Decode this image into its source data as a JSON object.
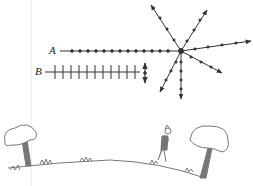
{
  "diagram": {
    "labels": {
      "ray_a": "A",
      "ray_b": "B"
    },
    "colors": {
      "line": "#333333",
      "scene": "#777777",
      "background": "#ffffff"
    },
    "scatter_center": {
      "x": 181,
      "y": 51
    },
    "scattered_ray_count": 7,
    "scene": [
      "left-tree",
      "grass-ground",
      "observer-person",
      "right-tree"
    ]
  }
}
